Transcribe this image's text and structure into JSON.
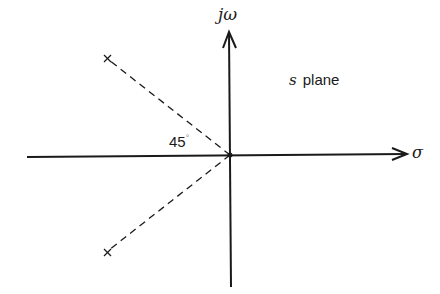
{
  "figure": {
    "axes": {
      "vertical_label": "jω",
      "horizontal_label": "σ"
    },
    "plane_label": {
      "variable": "s",
      "text": "plane"
    },
    "angle_annotation": {
      "value": "45",
      "unit": "°"
    },
    "poles": [
      {
        "marker": "×",
        "position": "upper-left",
        "angle_deg": 135
      },
      {
        "marker": "×",
        "position": "lower-left",
        "angle_deg": -135
      }
    ],
    "colors": {
      "stroke": "#1a1a1a",
      "background": "#ffffff"
    }
  }
}
